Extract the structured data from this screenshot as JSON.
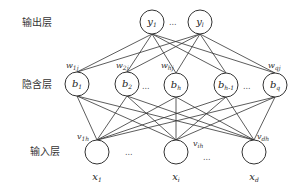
{
  "layers": {
    "output": {
      "label": "输出层",
      "nodes": [
        {
          "name": "y",
          "sub": "1",
          "x": 152,
          "y": 22
        },
        {
          "name": "y",
          "sub": "l",
          "x": 200,
          "y": 22
        }
      ],
      "ellipsis": "..."
    },
    "hidden": {
      "label": "隐含层",
      "nodes": [
        {
          "name": "b",
          "sub": "1",
          "x": 77,
          "y": 84
        },
        {
          "name": "b",
          "sub": "2",
          "x": 127,
          "y": 84
        },
        {
          "name": "b",
          "sub": "h",
          "x": 176,
          "y": 85
        },
        {
          "name": "b",
          "sub": "h-1",
          "x": 226,
          "y": 85
        },
        {
          "name": "b",
          "sub": "q",
          "x": 275,
          "y": 85
        }
      ],
      "ellipsis": "..."
    },
    "input": {
      "label": "输入层",
      "nodes": [
        {
          "name": "x",
          "sub": "1",
          "x": 97,
          "y": 152
        },
        {
          "name": "x",
          "sub": "i",
          "x": 176,
          "y": 152
        },
        {
          "name": "x",
          "sub": "d",
          "x": 254,
          "y": 152
        }
      ],
      "ellipsis": "..."
    }
  },
  "weights_hidden_output": [
    {
      "name": "w",
      "sub": "1j",
      "x": 66,
      "y": 68
    },
    {
      "name": "w",
      "sub": "2j",
      "x": 116,
      "y": 68
    },
    {
      "name": "w",
      "sub": "hj",
      "x": 161,
      "y": 68
    },
    {
      "name": "w",
      "sub": "qj",
      "x": 268,
      "y": 68
    }
  ],
  "weights_input_hidden": [
    {
      "name": "v",
      "sub": "1h",
      "x": 77,
      "y": 139
    },
    {
      "name": "v",
      "sub": "ih",
      "x": 193,
      "y": 146
    },
    {
      "name": "v",
      "sub": "dh",
      "x": 257,
      "y": 139
    }
  ],
  "colors": {
    "line": "#333333",
    "background": "#ffffff"
  }
}
